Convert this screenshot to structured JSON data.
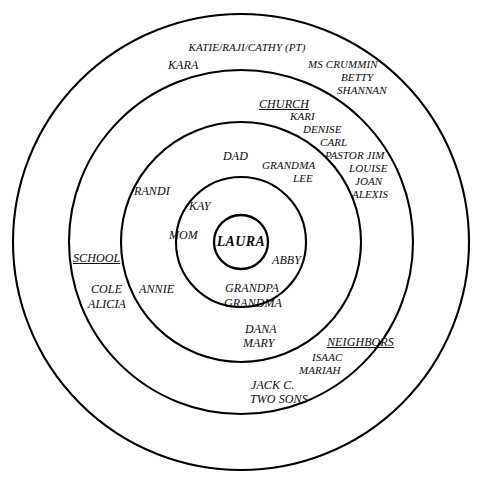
{
  "diagram": {
    "type": "concentric-circles",
    "stroke_color": "#000000",
    "text_color": "#0b0b0b",
    "background": "#ffffff",
    "center": {
      "x": 241,
      "y": 242
    },
    "rings": [
      {
        "index": 0,
        "name": "center",
        "radius": 27
      },
      {
        "index": 1,
        "name": "ring-1",
        "radius": 65
      },
      {
        "index": 2,
        "name": "ring-2",
        "radius": 120
      },
      {
        "index": 3,
        "name": "ring-3",
        "radius": 172
      },
      {
        "index": 4,
        "name": "ring-4",
        "radius": 228
      }
    ]
  },
  "center_label": "LAURA",
  "labels": [
    {
      "id": "katie-raji-cathy",
      "text": "KATIE/RAJI/CATHY (PT)",
      "x": 247,
      "y": 42,
      "size": "t11",
      "align": "center",
      "header": false
    },
    {
      "id": "kara",
      "text": "KARA",
      "x": 168,
      "y": 59,
      "size": "t12",
      "align": "left",
      "header": false
    },
    {
      "id": "ms-crummin",
      "text": "MS CRUMMIN",
      "x": 308,
      "y": 59,
      "size": "t11",
      "align": "left",
      "header": false
    },
    {
      "id": "betty",
      "text": "BETTY",
      "x": 341,
      "y": 72,
      "size": "t11",
      "align": "left",
      "header": false
    },
    {
      "id": "shannan",
      "text": "SHANNAN",
      "x": 337,
      "y": 85,
      "size": "t11",
      "align": "left",
      "header": false
    },
    {
      "id": "church",
      "text": "CHURCH",
      "x": 259,
      "y": 98,
      "size": "t12",
      "align": "left",
      "header": true
    },
    {
      "id": "kari",
      "text": "KARI",
      "x": 290,
      "y": 111,
      "size": "t11",
      "align": "left",
      "header": false
    },
    {
      "id": "denise",
      "text": "DENISE",
      "x": 303,
      "y": 124,
      "size": "t11",
      "align": "left",
      "header": false
    },
    {
      "id": "carl",
      "text": "CARL",
      "x": 320,
      "y": 137,
      "size": "t11",
      "align": "left",
      "header": false
    },
    {
      "id": "pastor-jim",
      "text": "PASTOR JIM",
      "x": 325,
      "y": 150,
      "size": "t11",
      "align": "left",
      "header": false
    },
    {
      "id": "dad",
      "text": "DAD",
      "x": 223,
      "y": 150,
      "size": "t12",
      "align": "left",
      "header": false
    },
    {
      "id": "grandma",
      "text": "GRANDMA",
      "x": 262,
      "y": 160,
      "size": "t11",
      "align": "left",
      "header": false
    },
    {
      "id": "louise",
      "text": "LOUISE",
      "x": 349,
      "y": 163,
      "size": "t11",
      "align": "left",
      "header": false
    },
    {
      "id": "lee",
      "text": "LEE",
      "x": 293,
      "y": 173,
      "size": "t11",
      "align": "left",
      "header": false
    },
    {
      "id": "joan",
      "text": "JOAN",
      "x": 355,
      "y": 176,
      "size": "t11",
      "align": "left",
      "header": false
    },
    {
      "id": "randi",
      "text": "RANDI",
      "x": 134,
      "y": 185,
      "size": "t12",
      "align": "left",
      "header": false
    },
    {
      "id": "alexis",
      "text": "ALEXIS",
      "x": 352,
      "y": 189,
      "size": "t11",
      "align": "left",
      "header": false
    },
    {
      "id": "kay",
      "text": "KAY",
      "x": 189,
      "y": 200,
      "size": "t12",
      "align": "left",
      "header": false
    },
    {
      "id": "mom",
      "text": "MOM",
      "x": 169,
      "y": 229,
      "size": "t12",
      "align": "left",
      "header": false
    },
    {
      "id": "abby",
      "text": "ABBY",
      "x": 272,
      "y": 254,
      "size": "t12",
      "align": "left",
      "header": false
    },
    {
      "id": "school",
      "text": "SCHOOL",
      "x": 73,
      "y": 252,
      "size": "t12",
      "align": "left",
      "header": true
    },
    {
      "id": "cole",
      "text": "COLE",
      "x": 91,
      "y": 283,
      "size": "t12",
      "align": "left",
      "header": false
    },
    {
      "id": "annie",
      "text": "ANNIE",
      "x": 139,
      "y": 283,
      "size": "t12",
      "align": "left",
      "header": false
    },
    {
      "id": "grandpa",
      "text": "GRANDPA",
      "x": 225,
      "y": 282,
      "size": "t12",
      "align": "left",
      "header": false
    },
    {
      "id": "alicia",
      "text": "ALICIA",
      "x": 88,
      "y": 298,
      "size": "t12",
      "align": "left",
      "header": false
    },
    {
      "id": "grandma-2",
      "text": "GRANDMA",
      "x": 224,
      "y": 297,
      "size": "t12",
      "align": "left",
      "header": false
    },
    {
      "id": "dana",
      "text": "DANA",
      "x": 245,
      "y": 323,
      "size": "t12",
      "align": "left",
      "header": false
    },
    {
      "id": "mary",
      "text": "MARY",
      "x": 243,
      "y": 337,
      "size": "t12",
      "align": "left",
      "header": false
    },
    {
      "id": "neighbors",
      "text": "NEIGHBORS",
      "x": 327,
      "y": 336,
      "size": "t12",
      "align": "left",
      "header": true
    },
    {
      "id": "isaac",
      "text": "ISAAC",
      "x": 312,
      "y": 352,
      "size": "t11",
      "align": "left",
      "header": false
    },
    {
      "id": "mariah",
      "text": "MARIAH",
      "x": 299,
      "y": 365,
      "size": "t11",
      "align": "left",
      "header": false
    },
    {
      "id": "jack-c",
      "text": "JACK C.",
      "x": 251,
      "y": 379,
      "size": "t12",
      "align": "left",
      "header": false
    },
    {
      "id": "two-sons",
      "text": "TWO SONS",
      "x": 250,
      "y": 393,
      "size": "t12",
      "align": "left",
      "header": false
    }
  ]
}
